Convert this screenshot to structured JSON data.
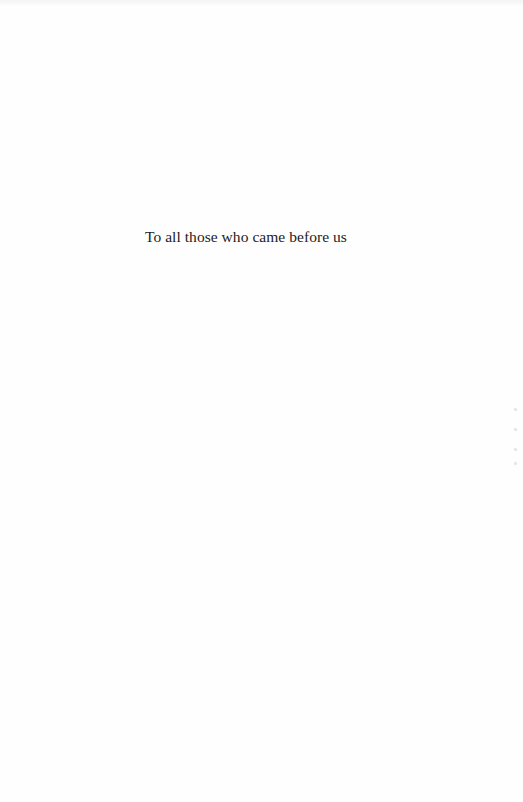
{
  "page": {
    "type": "dedication",
    "dedication_text": "To all those who came before us"
  }
}
